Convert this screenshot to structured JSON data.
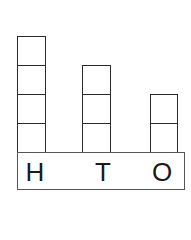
{
  "diagram": {
    "type": "place-value-blocks",
    "columns": [
      {
        "label": "H",
        "blocks": 4
      },
      {
        "label": "T",
        "blocks": 3
      },
      {
        "label": "O",
        "blocks": 2
      }
    ]
  }
}
